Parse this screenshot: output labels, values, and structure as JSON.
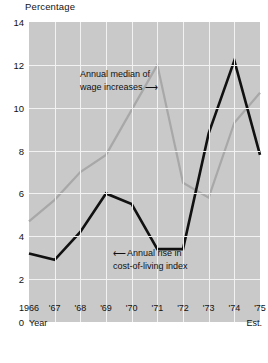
{
  "chart_data": {
    "type": "line",
    "title": "Percentage",
    "xlabel": "Year",
    "ylabel": "Percentage",
    "ylim": [
      0,
      14
    ],
    "ytick_labels": [
      "0",
      "2",
      "4",
      "6",
      "8",
      "10",
      "12",
      "14"
    ],
    "ytick_values": [
      0,
      2,
      4,
      6,
      8,
      10,
      12,
      14
    ],
    "grid": true,
    "legend_position": "inline-annotations",
    "categories": [
      "1966",
      "'67",
      "'68",
      "'69",
      "'70",
      "'71",
      "'72",
      "'73",
      "'74",
      "'75"
    ],
    "x_caption_left": "Year",
    "x_caption_right": "Est.",
    "series": [
      {
        "name": "Annual median of wage increases",
        "color": "#a8a8a8",
        "values": [
          4.7,
          5.7,
          7.0,
          7.8,
          9.9,
          12.0,
          6.5,
          5.8,
          9.3,
          10.7
        ]
      },
      {
        "name": "Annual rise in cost-of-living index",
        "color": "#111111",
        "values": [
          3.2,
          2.9,
          4.2,
          6.0,
          5.5,
          3.4,
          3.4,
          8.8,
          12.2,
          7.8
        ]
      }
    ],
    "annotations": [
      {
        "id": "wage",
        "line1": "Annual median of",
        "line2": "wage increases",
        "arrow": "⟶"
      },
      {
        "id": "col",
        "arrow": "⟵",
        "line1": "Annual rise in",
        "line2": "cost-of-living index"
      }
    ]
  },
  "colors": {
    "plot_background": "#c9c9c9",
    "grid": "#f2f2f2",
    "wage_line": "#a8a8a8",
    "cost_line": "#111111",
    "text": "#121212"
  }
}
